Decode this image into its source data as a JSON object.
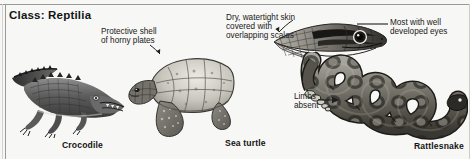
{
  "figure": {
    "title": "Class: Reptilia",
    "background_color": "#f7f7f5",
    "border_color": "#9a9a9a",
    "ink_color": "#202020"
  },
  "callouts": [
    {
      "id": "protective-shell",
      "text": "Protective shell\nof horny plates",
      "points_to": "sea-turtle-shell",
      "arrow": "down-right"
    },
    {
      "id": "dry-skin",
      "text": "Dry, watertight skin\ncovered with\noverlapping scales",
      "points_to": "snake-head-scales",
      "arrow": "down-right"
    },
    {
      "id": "developed-eyes",
      "text": "Most with well\ndeveloped eyes",
      "points_to": "snake-head-eye",
      "arrow": "left-line"
    },
    {
      "id": "limbs-absent",
      "text": "Limbs\nabsent",
      "points_to": "rattlesnake-body",
      "arrow": "right"
    }
  ],
  "specimens": [
    {
      "id": "crocodile",
      "caption": "Crocodile"
    },
    {
      "id": "sea-turtle",
      "caption": "Sea turtle"
    },
    {
      "id": "rattlesnake",
      "caption": "Rattlesnake"
    }
  ],
  "illustrations": [
    {
      "id": "crocodile-illustration",
      "subject": "crocodile, full body, side view"
    },
    {
      "id": "sea-turtle-illustration",
      "subject": "sea turtle, full body, side view"
    },
    {
      "id": "snake-head-illustration",
      "subject": "snake head in profile, scaled"
    },
    {
      "id": "rattlesnake-illustration",
      "subject": "coiled rattlesnake with rattle"
    }
  ]
}
